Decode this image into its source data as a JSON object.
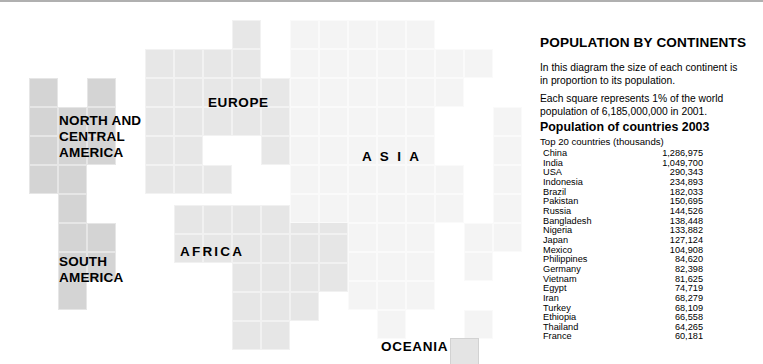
{
  "panel": {
    "title": "POPULATION BY CONTINENTS",
    "paragraph_1": "In this diagram the size of each continent is in proportion to its population.",
    "paragraph_2": "Each square  represents 1% of the world population of 6,185,000,000 in 2001.",
    "subtitle": "Population of countries 2003",
    "sub_subtitle": "Top 20 countries (thousands)"
  },
  "continent_labels": {
    "north_america": "NORTH AND\nCENTRAL\nAMERICA",
    "south_america": "SOUTH\nAMERICA",
    "europe": "EUROPE",
    "asia": "A S I A",
    "africa": "AFRICA",
    "oceania": "OCEANIA"
  },
  "countries": [
    {
      "name": "China",
      "population": "1,286,975"
    },
    {
      "name": "India",
      "population": "1,049,700"
    },
    {
      "name": "USA",
      "population": "290,343"
    },
    {
      "name": "Indonesia",
      "population": "234,893"
    },
    {
      "name": "Brazil",
      "population": "182,033"
    },
    {
      "name": "Pakistan",
      "population": "150,695"
    },
    {
      "name": "Russia",
      "population": "144,526"
    },
    {
      "name": "Bangladesh",
      "population": "138,448"
    },
    {
      "name": "Nigeria",
      "population": "133,882"
    },
    {
      "name": "Japan",
      "population": "127,124"
    },
    {
      "name": "Mexico",
      "population": "104,908"
    },
    {
      "name": "Philippines",
      "population": "84,620"
    },
    {
      "name": "Germany",
      "population": "82,398"
    },
    {
      "name": "Vietnam",
      "population": "81,625"
    },
    {
      "name": "Egypt",
      "population": "74,719"
    },
    {
      "name": "Iran",
      "population": "68,279"
    },
    {
      "name": "Turkey",
      "population": "68,109"
    },
    {
      "name": "Ethiopia",
      "population": "66,558"
    },
    {
      "name": "Thailand",
      "population": "64,265"
    },
    {
      "name": "France",
      "population": "60,181"
    }
  ],
  "colors": {
    "americas": "#d4d4d4",
    "europe": "#e7e7e7",
    "africa": "#e6e6e6",
    "asia": "#f4f4f4",
    "oceania": "#e4e4e4",
    "background": "#ffffff",
    "text": "#000000"
  },
  "cartogram": {
    "cell_size": 29,
    "note": "Each square represents 1% of world population",
    "cells": [
      {
        "continent": "americas",
        "x": 29,
        "y": 76
      },
      {
        "continent": "americas",
        "x": 29,
        "y": 105
      },
      {
        "continent": "americas",
        "x": 29,
        "y": 134
      },
      {
        "continent": "americas",
        "x": 29,
        "y": 163
      },
      {
        "continent": "americas",
        "x": 58,
        "y": 105
      },
      {
        "continent": "americas",
        "x": 58,
        "y": 134
      },
      {
        "continent": "americas",
        "x": 58,
        "y": 163
      },
      {
        "continent": "americas",
        "x": 87,
        "y": 76
      },
      {
        "continent": "americas",
        "x": 87,
        "y": 105
      },
      {
        "continent": "americas",
        "x": 87,
        "y": 134
      },
      {
        "continent": "americas",
        "x": 58,
        "y": 192
      },
      {
        "continent": "americas",
        "x": 58,
        "y": 221
      },
      {
        "continent": "americas",
        "x": 58,
        "y": 250
      },
      {
        "continent": "americas",
        "x": 58,
        "y": 279
      },
      {
        "continent": "americas",
        "x": 87,
        "y": 221
      },
      {
        "continent": "americas",
        "x": 87,
        "y": 250
      },
      {
        "continent": "europe",
        "x": 145,
        "y": 47
      },
      {
        "continent": "europe",
        "x": 174,
        "y": 47
      },
      {
        "continent": "europe",
        "x": 232,
        "y": 18
      },
      {
        "continent": "europe",
        "x": 232,
        "y": 47
      },
      {
        "continent": "europe",
        "x": 203,
        "y": 47
      },
      {
        "continent": "europe",
        "x": 145,
        "y": 76
      },
      {
        "continent": "europe",
        "x": 174,
        "y": 76
      },
      {
        "continent": "europe",
        "x": 203,
        "y": 76
      },
      {
        "continent": "europe",
        "x": 232,
        "y": 76
      },
      {
        "continent": "europe",
        "x": 261,
        "y": 76
      },
      {
        "continent": "europe",
        "x": 145,
        "y": 105
      },
      {
        "continent": "europe",
        "x": 174,
        "y": 105
      },
      {
        "continent": "europe",
        "x": 203,
        "y": 105
      },
      {
        "continent": "europe",
        "x": 232,
        "y": 105
      },
      {
        "continent": "europe",
        "x": 261,
        "y": 105
      },
      {
        "continent": "europe",
        "x": 145,
        "y": 134
      },
      {
        "continent": "europe",
        "x": 174,
        "y": 134
      },
      {
        "continent": "europe",
        "x": 261,
        "y": 134
      },
      {
        "continent": "europe",
        "x": 145,
        "y": 163
      },
      {
        "continent": "europe",
        "x": 174,
        "y": 163
      },
      {
        "continent": "europe",
        "x": 203,
        "y": 163
      },
      {
        "continent": "africa",
        "x": 174,
        "y": 203
      },
      {
        "continent": "africa",
        "x": 203,
        "y": 203
      },
      {
        "continent": "africa",
        "x": 232,
        "y": 203
      },
      {
        "continent": "africa",
        "x": 261,
        "y": 203
      },
      {
        "continent": "africa",
        "x": 290,
        "y": 203
      },
      {
        "continent": "africa",
        "x": 319,
        "y": 203
      },
      {
        "continent": "africa",
        "x": 174,
        "y": 232
      },
      {
        "continent": "africa",
        "x": 203,
        "y": 232
      },
      {
        "continent": "africa",
        "x": 232,
        "y": 232
      },
      {
        "continent": "africa",
        "x": 261,
        "y": 232
      },
      {
        "continent": "africa",
        "x": 290,
        "y": 232
      },
      {
        "continent": "africa",
        "x": 319,
        "y": 232
      },
      {
        "continent": "africa",
        "x": 232,
        "y": 261
      },
      {
        "continent": "africa",
        "x": 261,
        "y": 261
      },
      {
        "continent": "africa",
        "x": 290,
        "y": 261
      },
      {
        "continent": "africa",
        "x": 319,
        "y": 261
      },
      {
        "continent": "africa",
        "x": 232,
        "y": 290
      },
      {
        "continent": "africa",
        "x": 261,
        "y": 290
      },
      {
        "continent": "africa",
        "x": 290,
        "y": 290
      },
      {
        "continent": "africa",
        "x": 232,
        "y": 319
      },
      {
        "continent": "africa",
        "x": 261,
        "y": 319
      },
      {
        "continent": "asia",
        "x": 290,
        "y": 18
      },
      {
        "continent": "asia",
        "x": 319,
        "y": 18
      },
      {
        "continent": "asia",
        "x": 348,
        "y": 18
      },
      {
        "continent": "asia",
        "x": 377,
        "y": 18
      },
      {
        "continent": "asia",
        "x": 406,
        "y": 18
      },
      {
        "continent": "asia",
        "x": 290,
        "y": 47
      },
      {
        "continent": "asia",
        "x": 319,
        "y": 47
      },
      {
        "continent": "asia",
        "x": 348,
        "y": 47
      },
      {
        "continent": "asia",
        "x": 377,
        "y": 47
      },
      {
        "continent": "asia",
        "x": 406,
        "y": 47
      },
      {
        "continent": "asia",
        "x": 435,
        "y": 47
      },
      {
        "continent": "asia",
        "x": 464,
        "y": 47
      },
      {
        "continent": "asia",
        "x": 290,
        "y": 76
      },
      {
        "continent": "asia",
        "x": 319,
        "y": 76
      },
      {
        "continent": "asia",
        "x": 348,
        "y": 76
      },
      {
        "continent": "asia",
        "x": 377,
        "y": 76
      },
      {
        "continent": "asia",
        "x": 406,
        "y": 76
      },
      {
        "continent": "asia",
        "x": 435,
        "y": 76
      },
      {
        "continent": "asia",
        "x": 290,
        "y": 105
      },
      {
        "continent": "asia",
        "x": 319,
        "y": 105
      },
      {
        "continent": "asia",
        "x": 348,
        "y": 105
      },
      {
        "continent": "asia",
        "x": 377,
        "y": 105
      },
      {
        "continent": "asia",
        "x": 406,
        "y": 105
      },
      {
        "continent": "asia",
        "x": 493,
        "y": 105
      },
      {
        "continent": "asia",
        "x": 290,
        "y": 134
      },
      {
        "continent": "asia",
        "x": 319,
        "y": 134
      },
      {
        "continent": "asia",
        "x": 348,
        "y": 134
      },
      {
        "continent": "asia",
        "x": 377,
        "y": 134
      },
      {
        "continent": "asia",
        "x": 406,
        "y": 134
      },
      {
        "continent": "asia",
        "x": 493,
        "y": 134
      },
      {
        "continent": "asia",
        "x": 290,
        "y": 163
      },
      {
        "continent": "asia",
        "x": 319,
        "y": 163
      },
      {
        "continent": "asia",
        "x": 348,
        "y": 163
      },
      {
        "continent": "asia",
        "x": 377,
        "y": 163
      },
      {
        "continent": "asia",
        "x": 406,
        "y": 163
      },
      {
        "continent": "asia",
        "x": 435,
        "y": 163
      },
      {
        "continent": "asia",
        "x": 493,
        "y": 163
      },
      {
        "continent": "asia",
        "x": 290,
        "y": 192
      },
      {
        "continent": "asia",
        "x": 319,
        "y": 192
      },
      {
        "continent": "asia",
        "x": 348,
        "y": 192
      },
      {
        "continent": "asia",
        "x": 377,
        "y": 192
      },
      {
        "continent": "asia",
        "x": 406,
        "y": 192
      },
      {
        "continent": "asia",
        "x": 435,
        "y": 192
      },
      {
        "continent": "asia",
        "x": 493,
        "y": 192
      },
      {
        "continent": "asia",
        "x": 348,
        "y": 221
      },
      {
        "continent": "asia",
        "x": 377,
        "y": 221
      },
      {
        "continent": "asia",
        "x": 406,
        "y": 221
      },
      {
        "continent": "asia",
        "x": 464,
        "y": 221
      },
      {
        "continent": "asia",
        "x": 493,
        "y": 221
      },
      {
        "continent": "asia",
        "x": 348,
        "y": 250
      },
      {
        "continent": "asia",
        "x": 377,
        "y": 250
      },
      {
        "continent": "asia",
        "x": 406,
        "y": 250
      },
      {
        "continent": "asia",
        "x": 464,
        "y": 250
      },
      {
        "continent": "asia",
        "x": 348,
        "y": 279
      },
      {
        "continent": "asia",
        "x": 377,
        "y": 279
      },
      {
        "continent": "asia",
        "x": 406,
        "y": 279
      },
      {
        "continent": "asia",
        "x": 377,
        "y": 308
      },
      {
        "continent": "asia",
        "x": 464,
        "y": 308
      },
      {
        "continent": "oceania",
        "x": 450,
        "y": 336
      }
    ]
  }
}
